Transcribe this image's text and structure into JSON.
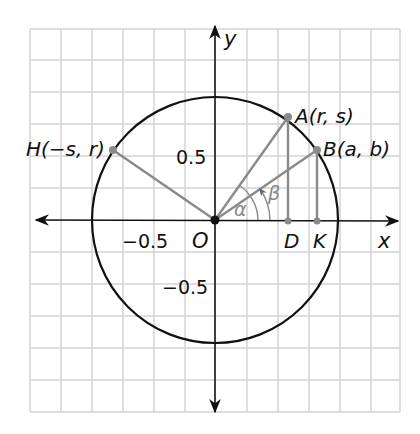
{
  "diagram": {
    "type": "unit-circle",
    "axes": {
      "x_label": "x",
      "y_label": "y"
    },
    "ticks": {
      "x_neg": "−0.5",
      "y_pos": "0.5",
      "y_neg": "−0.5"
    },
    "origin_label": "O",
    "points": {
      "A": {
        "label": "A(r, s)",
        "name": "A",
        "coords": "(r, s)"
      },
      "B": {
        "label": "B(a, b)",
        "name": "B",
        "coords": "(a, b)"
      },
      "H": {
        "label": "H(−s, r)",
        "name": "H",
        "coords": "(−s, r)"
      },
      "D": {
        "label": "D"
      },
      "K": {
        "label": "K"
      }
    },
    "angles": {
      "alpha": "α",
      "beta": "β"
    },
    "colors": {
      "grid": "#d0d0d0",
      "circle": "#111111",
      "segments": "#8a8a8a",
      "axes": "#111111"
    }
  }
}
